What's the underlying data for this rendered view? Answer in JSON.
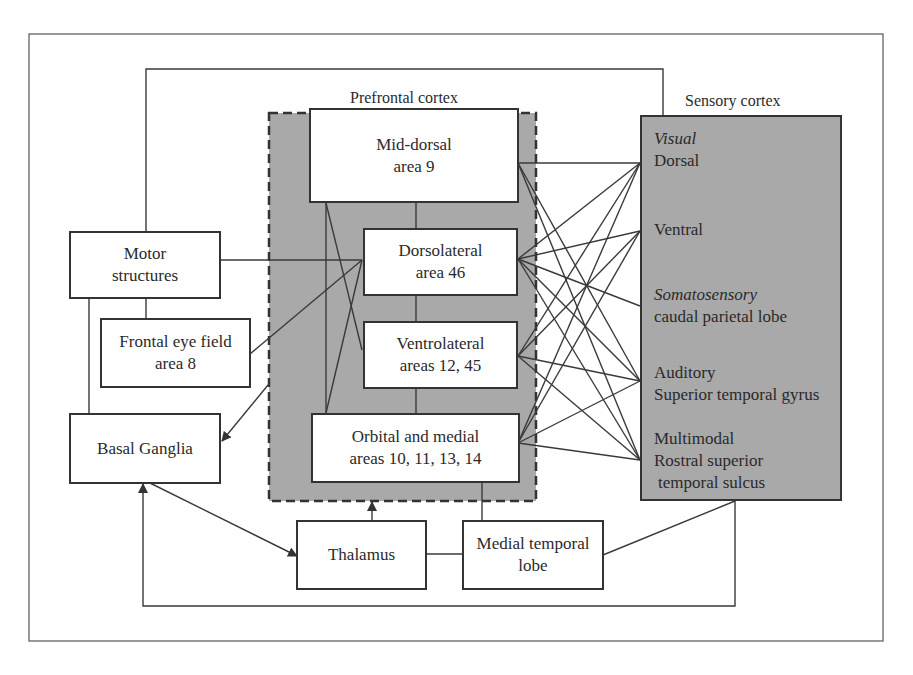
{
  "diagram": {
    "groups": {
      "prefrontal": {
        "title": "Prefrontal cortex",
        "fill": "#a9a9a9",
        "border": "dashed"
      },
      "sensory": {
        "title": "Sensory cortex",
        "fill": "#a9a9a9",
        "border": "solid"
      }
    },
    "prefrontal_areas": {
      "mid_dorsal": {
        "line1": "Mid-dorsal",
        "line2": "area 9"
      },
      "dorsolateral": {
        "line1": "Dorsolateral",
        "line2": "area 46"
      },
      "ventrolateral": {
        "line1": "Ventrolateral",
        "line2": "areas 12, 45"
      },
      "orbital_medial": {
        "line1": "Orbital and medial",
        "line2": "areas 10, 11, 13, 14"
      }
    },
    "sensory_areas": {
      "visual": {
        "category": "Visual",
        "sub1": "Dorsal",
        "sub2": "Ventral"
      },
      "somatosensory": {
        "category": "Somatosensory",
        "sub": "caudal parietal lobe"
      },
      "auditory": {
        "category": "Auditory",
        "sub": "Superior temporal gyrus"
      },
      "multimodal": {
        "category": "Multimodal",
        "sub1": "Rostral superior",
        "sub2": "temporal sulcus"
      }
    },
    "other_structures": {
      "motor": {
        "line1": "Motor",
        "line2": "structures"
      },
      "frontal_eye_field": {
        "line1": "Frontal eye field",
        "line2": "area 8"
      },
      "basal_ganglia": {
        "label": "Basal Ganglia"
      },
      "thalamus": {
        "label": "Thalamus"
      },
      "medial_temporal": {
        "line1": "Medial temporal",
        "line2": "lobe"
      }
    },
    "connections": [
      {
        "from": "Mid-dorsal",
        "to": [
          "Dorsal",
          "Auditory",
          "Multimodal"
        ]
      },
      {
        "from": "Dorsolateral",
        "to": [
          "Dorsal",
          "Ventral",
          "Somatosensory",
          "Auditory",
          "Multimodal"
        ]
      },
      {
        "from": "Ventrolateral",
        "to": [
          "Dorsal",
          "Ventral",
          "Auditory",
          "Multimodal"
        ]
      },
      {
        "from": "Orbital and medial",
        "to": [
          "Dorsal",
          "Ventral",
          "Auditory",
          "Multimodal"
        ]
      },
      {
        "from": "Motor structures",
        "to": [
          "Dorsolateral",
          "Basal Ganglia",
          "Frontal eye field",
          "Sensory cortex"
        ]
      },
      {
        "from": "Frontal eye field",
        "to": [
          "Dorsolateral"
        ]
      },
      {
        "from": "Prefrontal cortex",
        "to": [
          "Basal Ganglia"
        ],
        "arrow": true
      },
      {
        "from": "Basal Ganglia",
        "to": [
          "Thalamus"
        ],
        "arrow": true
      },
      {
        "from": "Thalamus",
        "to": [
          "Prefrontal cortex"
        ],
        "arrow": true
      },
      {
        "from": "Thalamus",
        "to": [
          "Medial temporal lobe"
        ]
      },
      {
        "from": "Medial temporal lobe",
        "to": [
          "Orbital and medial",
          "Sensory cortex"
        ]
      },
      {
        "from": "Sensory cortex",
        "to": [
          "Basal Ganglia"
        ],
        "arrow": true
      }
    ],
    "colors": {
      "line": "#3a3a3a",
      "shade": "#a9a9a9",
      "box_fill": "#ffffff"
    }
  }
}
